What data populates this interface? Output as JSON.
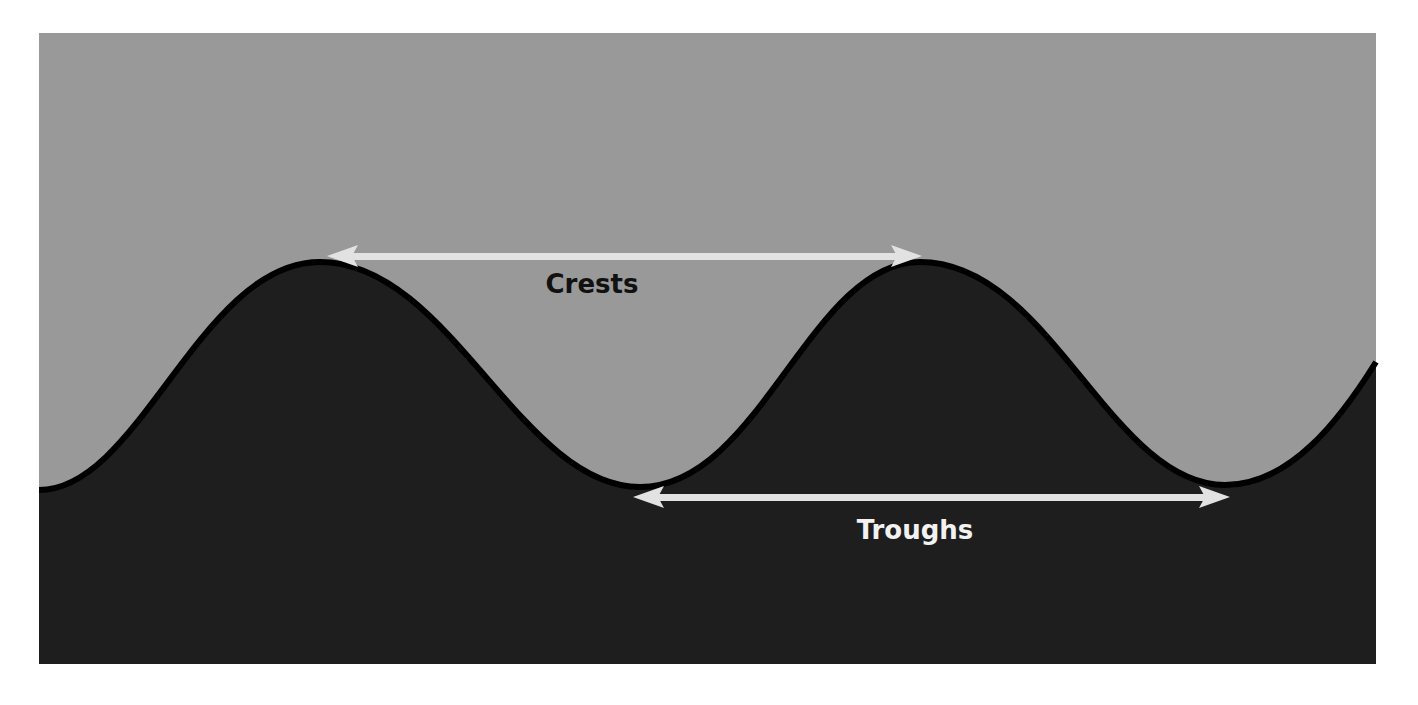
{
  "diagram": {
    "labels": {
      "crests": "Crests",
      "troughs": "Troughs"
    },
    "colors": {
      "sky": "#999999",
      "ground": "#1e1e1e",
      "outline": "#000000",
      "arrow": "#e2e2e2",
      "crests_text": "#111111",
      "troughs_text": "#f2f2f2",
      "page": "#ffffff"
    },
    "arrows": [
      {
        "name": "crests",
        "from": [
          327,
          256
        ],
        "to": [
          922,
          256
        ]
      },
      {
        "name": "troughs",
        "from": [
          633,
          497
        ],
        "to": [
          1230,
          497
        ]
      }
    ]
  }
}
